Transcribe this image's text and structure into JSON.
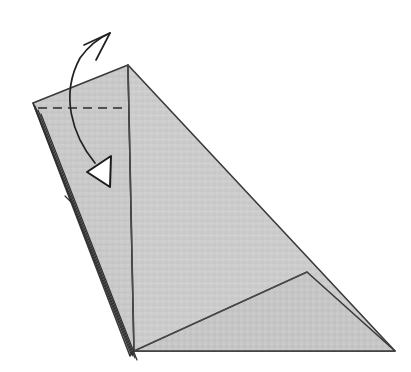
{
  "figure": {
    "kind": "line-drawing",
    "caption": "",
    "background_color": "#ffffff"
  },
  "palette": {
    "paper_fill": "#c9c9c9",
    "paper_fill_light": "#d2d2d2",
    "paper_fill_shade": "#c2c2c2",
    "outline": "#3a3a3a",
    "crease": "#4a4a4a",
    "dashed_fold": "#2b2b2b",
    "arrow": "#222222",
    "arrowhead_fill": "#ffffff",
    "arrowhead_stroke": "#1c1c1c"
  },
  "canvas": {
    "width": 411,
    "height": 372
  },
  "vertices": {
    "apex": [
      128,
      65
    ],
    "left_corner": [
      33,
      103
    ],
    "bottom_corner": [
      134,
      351
    ],
    "bottom_right_corner": [
      395,
      351
    ],
    "spine_bottom": [
      134,
      351
    ],
    "layer_tip": [
      130,
      356
    ]
  },
  "shapes": [
    {
      "name": "left-panel",
      "label": "Left narrow panel",
      "points": "33,103 128,65 134,351 130,356",
      "fill": "#c9c9c9"
    },
    {
      "name": "right-panel-upper",
      "label": "Large right triangular panel",
      "points": "128,65 395,351 134,351",
      "fill": "#cccccc"
    },
    {
      "name": "lower-flap",
      "label": "Lower flap below interior crease",
      "points": "134,351 307,272 395,351",
      "fill": "#c6c6c6"
    }
  ],
  "lines": {
    "spine": {
      "name": "vertical-spine-crease",
      "label": "Vertical crease from apex to bottom corner",
      "d": "M128,65 L134,351"
    },
    "interior_diagonal": {
      "name": "interior-diagonal-crease",
      "label": "Diagonal crease to right edge",
      "d": "M134,351 L307,272"
    },
    "dashed_fold": {
      "name": "valley-fold-dashed-line",
      "label": "Dashed fold line",
      "d": "M38,108 L128,108",
      "dash_pattern": "9 6"
    },
    "layer_edges": [
      {
        "name": "layer-edge-1",
        "d": "M33,103 L131,354"
      },
      {
        "name": "layer-edge-2",
        "d": "M35,106 L133,356"
      },
      {
        "name": "layer-edge-3",
        "d": "M38,110 L135,358"
      },
      {
        "name": "layer-edge-4",
        "d": "M41,114 L137,360"
      }
    ],
    "layer_notch": {
      "name": "layer-notch-mark",
      "label": "Small notch on layered edge",
      "d": "M65,196 L72,203"
    }
  },
  "arrow": {
    "name": "fold-direction-arrow",
    "label": "Curved arrow indicating fold direction",
    "curve_d": "M95,163 C72,135 60,95 80,58 C90,44 101,37 110,33",
    "tip": [
      110,
      33
    ],
    "barb_d": "M110,33 L84,45 M110,33 L96,60",
    "arrowhead": {
      "name": "hollow-triangle-arrowhead",
      "points": "87,172 111,156 110,187",
      "direction": "left"
    }
  }
}
